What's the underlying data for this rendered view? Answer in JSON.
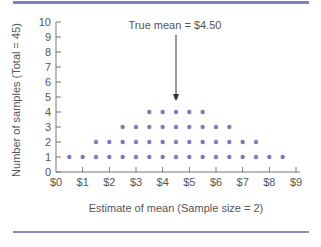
{
  "chart_data": {
    "type": "scatter",
    "subtype": "dot-plot",
    "title": "",
    "xlabel": "Estimate of mean (Sample size = 2)",
    "ylabel": "Number of samples (Total = 45)",
    "xlim": [
      0,
      9
    ],
    "ylim": [
      0,
      10
    ],
    "x_ticks": [
      "$0",
      "$1",
      "$2",
      "$3",
      "$4",
      "$5",
      "$6",
      "$7",
      "$8",
      "$9"
    ],
    "y_ticks": [
      "0",
      "1",
      "2",
      "3",
      "4",
      "5",
      "6",
      "7",
      "8",
      "9",
      "10"
    ],
    "grid": false,
    "annotation": {
      "text": "True mean = $4.50",
      "x": 4.5
    },
    "dot_color": "#7a7eb8",
    "rule_color": "#7d82b8",
    "x": [
      0.5,
      1.0,
      1.5,
      2.0,
      2.5,
      3.0,
      3.5,
      4.0,
      4.5,
      5.0,
      5.5,
      6.0,
      6.5,
      7.0,
      7.5,
      8.0,
      8.5
    ],
    "counts": [
      1,
      1,
      2,
      2,
      3,
      3,
      4,
      4,
      5,
      4,
      4,
      3,
      3,
      2,
      2,
      1,
      1
    ]
  }
}
